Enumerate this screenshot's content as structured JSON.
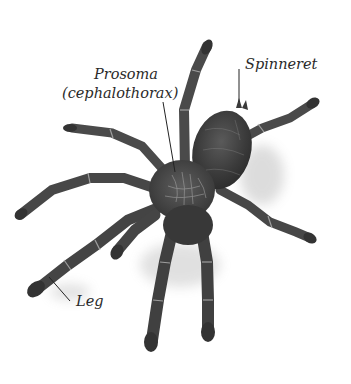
{
  "figure": {
    "background": "#ffffff",
    "body_color": "#3a3a3a",
    "leg_color": "#454545",
    "hair_color": "#9a9a9a"
  },
  "labels": {
    "prosoma_line1": "Prosoma",
    "prosoma_line2": "(cephalothorax)",
    "spinneret": "Spinneret",
    "leg": "Leg"
  },
  "leader_lines": {
    "prosoma": {
      "x1": 163,
      "y1": 102,
      "x2": 175,
      "y2": 172
    },
    "spinneret": {
      "x1": 239,
      "y1": 69,
      "x2": 239,
      "y2": 102
    },
    "leg": {
      "x1": 49,
      "y1": 277,
      "x2": 70,
      "y2": 301
    }
  }
}
